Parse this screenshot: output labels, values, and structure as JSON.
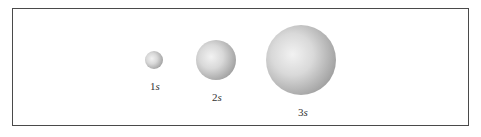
{
  "diagram": {
    "title": "",
    "orbitals": [
      {
        "number": "1",
        "letter": "s",
        "cx": 154,
        "cy": 60,
        "r": 9,
        "label_y": 80
      },
      {
        "number": "2",
        "letter": "s",
        "cx": 216,
        "cy": 60,
        "r": 20,
        "label_y": 91
      },
      {
        "number": "3",
        "letter": "s",
        "cx": 301,
        "cy": 60,
        "r": 35,
        "label_y": 106
      }
    ]
  }
}
